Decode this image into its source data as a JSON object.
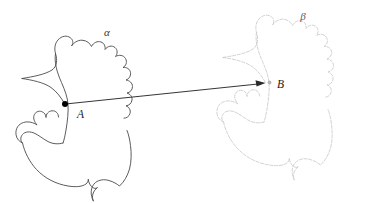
{
  "figure": {
    "kind": "geometric-region-mapping-diagram",
    "background_color": "#ffffff",
    "width": 366,
    "height": 203
  },
  "regions": {
    "alpha": {
      "label": "α",
      "label_x": 107,
      "label_y": 36,
      "stroke_color": "#4a4a4a",
      "style": "solid"
    },
    "beta": {
      "label": "β",
      "label_x": 303,
      "label_y": 20,
      "stroke_color": "#c9c9c9",
      "style": "dotted"
    }
  },
  "points": {
    "a": {
      "label": "A",
      "x": 65,
      "y": 104,
      "label_x": 77,
      "label_y": 118,
      "marker": "filled-dot",
      "color": "#000000"
    },
    "b": {
      "label": "B",
      "x": 266,
      "y": 83,
      "label_x": 277,
      "label_y": 88,
      "marker": "faded-dot",
      "color": "#b6b6b6"
    }
  },
  "vector": {
    "name": "translation-arrow",
    "from": "A",
    "to": "B",
    "color": "#2a2a2a",
    "has_arrowhead": true
  }
}
